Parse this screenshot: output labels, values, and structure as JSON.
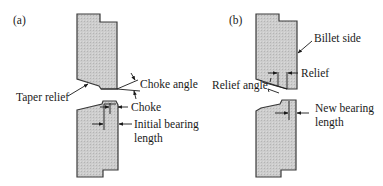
{
  "figure": {
    "panels": [
      {
        "id": "a",
        "label": "(a)",
        "annotations": {
          "choke_angle": "Choke angle",
          "taper_relief": "Taper relief",
          "choke": "Choke",
          "initial_bearing_line1": "Initial bearing",
          "initial_bearing_line2": "length"
        }
      },
      {
        "id": "b",
        "label": "(b)",
        "annotations": {
          "billet_side": "Billet side",
          "relief": "Relief",
          "relief_angle": "Relief angle",
          "new_bearing_line1": "New bearing",
          "new_bearing_line2": "length"
        }
      }
    ],
    "colors": {
      "fill": "#c9c9c9",
      "outline": "#3a3a3a",
      "text": "#1a1a1a",
      "background": "#ffffff"
    }
  }
}
